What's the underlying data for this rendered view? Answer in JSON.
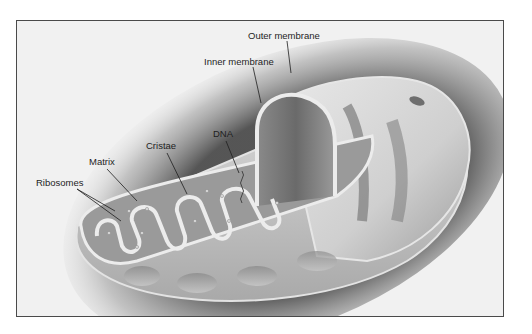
{
  "diagram": {
    "labels": [
      {
        "id": "outer-membrane",
        "text": "Outer membrane"
      },
      {
        "id": "inner-membrane",
        "text": "Inner membrane"
      },
      {
        "id": "dna",
        "text": "DNA"
      },
      {
        "id": "cristae",
        "text": "Cristae"
      },
      {
        "id": "matrix",
        "text": "Matrix"
      },
      {
        "id": "ribosomes",
        "text": "Ribosomes"
      }
    ],
    "colors": {
      "background": "#f1f1f1",
      "frame_border": "#4a4a4a",
      "membrane_light": "#e6e6e6",
      "membrane_mid": "#b8b8b8",
      "interior_dark": "#7a7a7a",
      "shadow": "#3a3a3a",
      "leader_line": "#1e1e1e"
    }
  }
}
